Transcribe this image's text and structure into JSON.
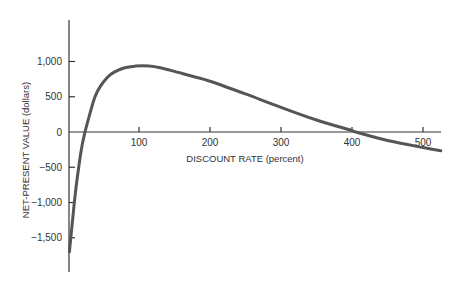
{
  "chart_data": {
    "type": "line",
    "title": "",
    "xlabel": "DISCOUNT RATE (percent)",
    "ylabel": "NET-PRESENT VALUE (dollars)",
    "xlim": [
      0,
      520
    ],
    "ylim": [
      -1900,
      1450
    ],
    "grid": false,
    "legend": null,
    "x_ticks": [
      100,
      200,
      300,
      400,
      500
    ],
    "x_tick_labels": [
      "100",
      "200",
      "300",
      "400",
      "500"
    ],
    "y_ticks": [
      1000,
      500,
      0,
      -500,
      -1000,
      -1500
    ],
    "y_tick_labels": [
      "1,000",
      "500",
      "0",
      "−1,000",
      "−1,500"
    ],
    "y_tick_labels_full": [
      "1,000",
      "500",
      "0",
      "−500",
      "−1,000",
      "−1,500"
    ],
    "series": [
      {
        "name": "Net-present value",
        "color": "#555555",
        "x": [
          2,
          5,
          10,
          15,
          20,
          24,
          30,
          38,
          45,
          55,
          65,
          80,
          95,
          105,
          115,
          130,
          150,
          175,
          200,
          250,
          300,
          350,
          400,
          405,
          450,
          500,
          525
        ],
        "y": [
          -1700,
          -1400,
          -900,
          -500,
          -180,
          0,
          230,
          500,
          640,
          770,
          850,
          910,
          935,
          940,
          935,
          910,
          860,
          790,
          720,
          540,
          350,
          170,
          20,
          0,
          -120,
          -220,
          -265
        ]
      }
    ],
    "annotations": []
  }
}
